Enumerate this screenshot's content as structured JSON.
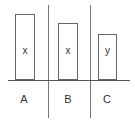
{
  "diagram": {
    "columns": [
      {
        "label": "A",
        "bar_label": "x",
        "bar": {
          "left": 15,
          "top": 14,
          "width": 20,
          "height": 66
        }
      },
      {
        "label": "B",
        "bar_label": "x",
        "bar": {
          "left": 58,
          "top": 23,
          "width": 20,
          "height": 57
        }
      },
      {
        "label": "C",
        "bar_label": "y",
        "bar": {
          "left": 98,
          "top": 34,
          "width": 19,
          "height": 46
        }
      }
    ],
    "baseline": {
      "y": 80,
      "x1": 8,
      "x2": 130
    },
    "dividers": [
      {
        "x": 48,
        "y1": 5,
        "y2": 118
      },
      {
        "x": 90,
        "y1": 5,
        "y2": 118
      }
    ],
    "colors": {
      "stroke": "#666666",
      "text": "#333333",
      "background": "#ffffff"
    }
  }
}
